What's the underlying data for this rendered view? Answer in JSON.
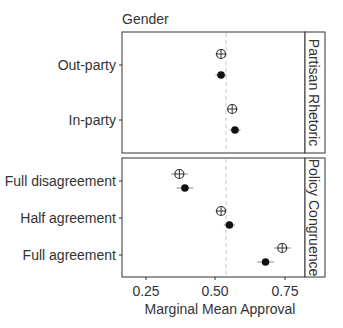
{
  "chart_data": {
    "type": "scatter",
    "subtitle": "Gender",
    "xlabel": "Marginal Mean Approval",
    "ylabel": "",
    "xlim": [
      0.16,
      0.84
    ],
    "xticks": [
      0.25,
      0.5,
      0.75
    ],
    "xtick_labels": [
      "0.25",
      "0.50",
      "0.75"
    ],
    "reference_line": 0.54,
    "grid": false,
    "legend": "none",
    "marker_styles": {
      "open": "circle with cross (open)",
      "filled": "filled circle"
    },
    "panels": [
      {
        "strip_label": "Partisan Rhetoric",
        "categories": [
          "Out-party",
          "In-party"
        ],
        "series": [
          {
            "name": "open",
            "values": [
              0.52,
              0.56
            ],
            "ci_halfwidth": [
              0.02,
              0.02
            ]
          },
          {
            "name": "filled",
            "values": [
              0.52,
              0.57
            ],
            "ci_halfwidth": [
              0.02,
              0.02
            ]
          }
        ]
      },
      {
        "strip_label": "Policy Congruence",
        "categories": [
          "Full disagreement",
          "Half agreement",
          "Full agreement"
        ],
        "series": [
          {
            "name": "open",
            "values": [
              0.37,
              0.52,
              0.74
            ],
            "ci_halfwidth": [
              0.03,
              0.02,
              0.03
            ]
          },
          {
            "name": "filled",
            "values": [
              0.39,
              0.55,
              0.68
            ],
            "ci_halfwidth": [
              0.03,
              0.02,
              0.03
            ]
          }
        ]
      }
    ]
  },
  "labels": {
    "subtitle": "Gender",
    "xlabel": "Marginal Mean Approval",
    "strip_top": "Partisan Rhetoric",
    "strip_bottom": "Policy Congruence",
    "xticks": [
      "0.25",
      "0.50",
      "0.75"
    ],
    "cat_top": [
      "Out-party",
      "In-party"
    ],
    "cat_bottom": [
      "Full disagreement",
      "Half agreement",
      "Full agreement"
    ]
  },
  "colors": {
    "point": "#111111",
    "open_stroke": "#333333",
    "border": "#333333",
    "refline": "#c8c8c8",
    "ci": "#888888"
  }
}
